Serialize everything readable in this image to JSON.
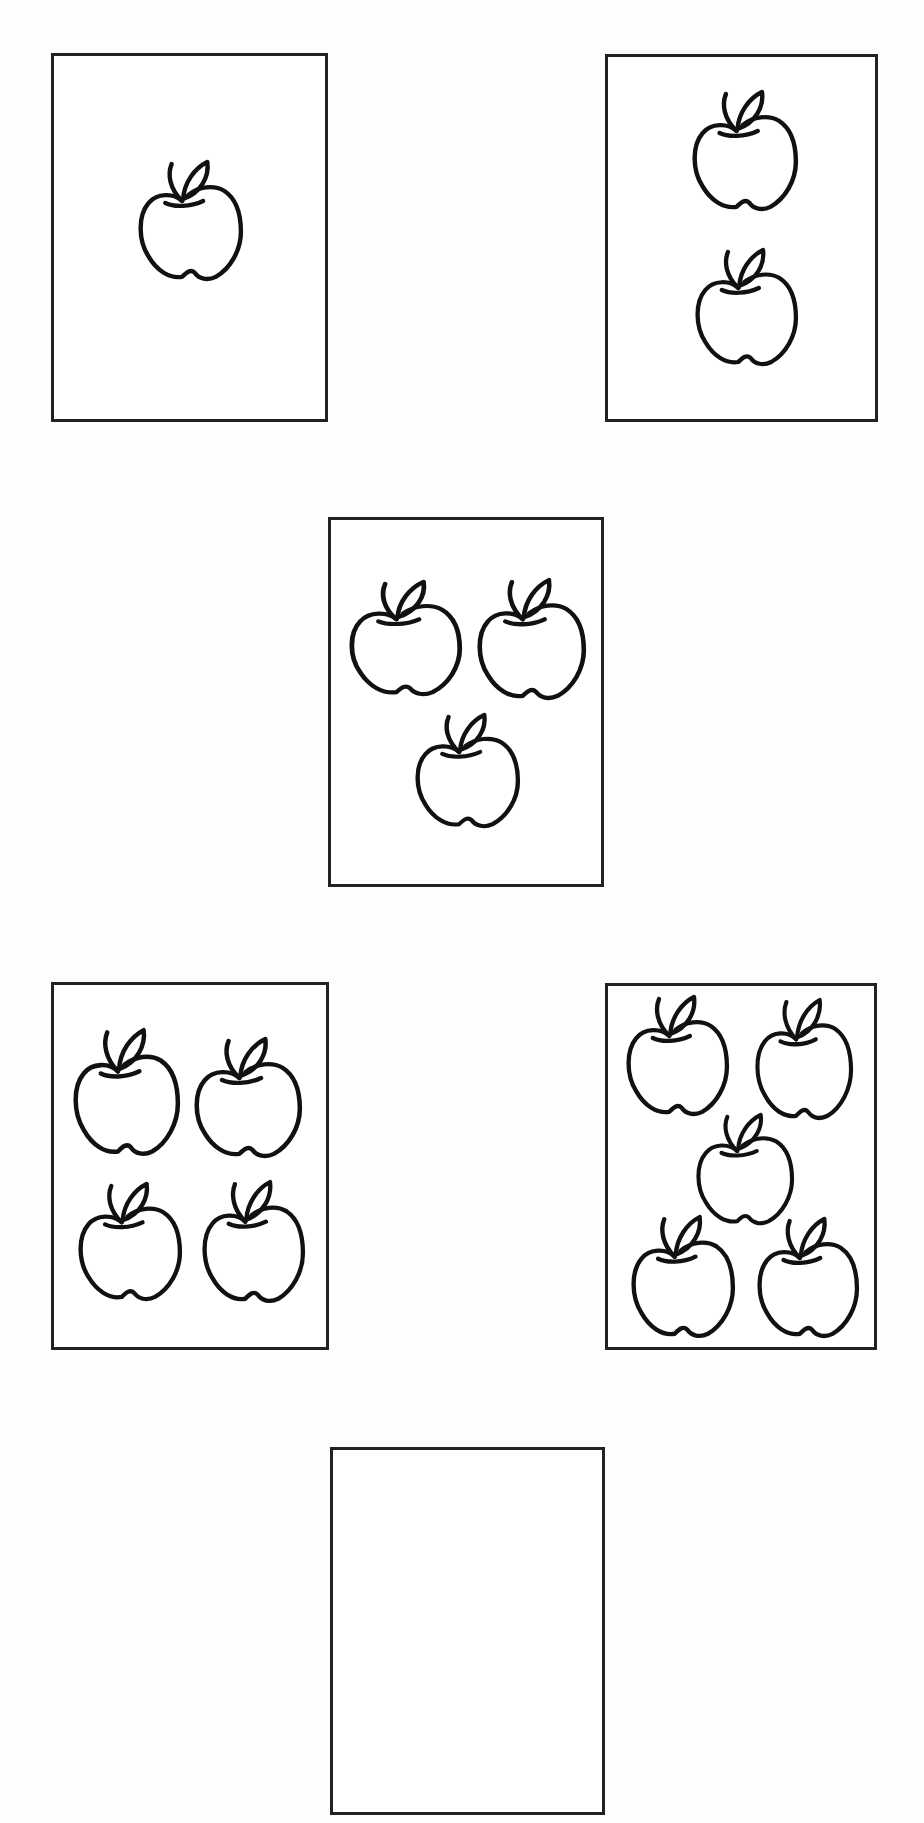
{
  "worksheet": {
    "cards": [
      {
        "id": "card-1",
        "count": 1,
        "box": [
          51,
          53,
          277,
          369
        ],
        "apples": [
          [
            87,
            107,
            105,
            123
          ]
        ]
      },
      {
        "id": "card-2",
        "count": 2,
        "box": [
          605,
          54,
          273,
          368
        ],
        "apples": [
          [
            87,
            36,
            106,
            123
          ],
          [
            90,
            194,
            103,
            120
          ]
        ]
      },
      {
        "id": "card-3",
        "count": 3,
        "box": [
          328,
          517,
          276,
          370
        ],
        "apples": [
          [
            21,
            63,
            113,
            118
          ],
          [
            149,
            61,
            109,
            124
          ],
          [
            87,
            196,
            105,
            117
          ]
        ]
      },
      {
        "id": "card-4",
        "count": 4,
        "box": [
          51,
          982,
          278,
          368
        ],
        "apples": [
          [
            22,
            46,
            107,
            130
          ],
          [
            143,
            55,
            108,
            123
          ],
          [
            27,
            200,
            104,
            121
          ],
          [
            151,
            198,
            103,
            125
          ]
        ]
      },
      {
        "id": "card-5",
        "count": 5,
        "box": [
          605,
          983,
          272,
          367
        ],
        "apples": [
          [
            21,
            12,
            103,
            123
          ],
          [
            150,
            15,
            98,
            124
          ],
          [
            91,
            130,
            98,
            114
          ],
          [
            26,
            232,
            104,
            125
          ],
          [
            152,
            234,
            102,
            123
          ]
        ]
      },
      {
        "id": "card-6",
        "count": 0,
        "box": [
          330,
          1447,
          275,
          368
        ],
        "apples": [],
        "note": "empty answer box"
      }
    ],
    "icon": "apple-icon",
    "stroke_color": "#111111",
    "border_color": "#222222"
  }
}
